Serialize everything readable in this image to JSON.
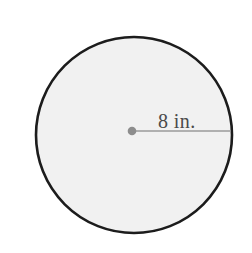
{
  "figure": {
    "type": "geometry-diagram",
    "shape": "circle",
    "background_color": "#ffffff",
    "canvas": {
      "width": 252,
      "height": 253
    },
    "circle": {
      "name": "shaded-circle",
      "center_x": 134,
      "center_y": 135,
      "radius": 98,
      "fill_color": "#f1f1f1",
      "stroke_color": "#1c1c1c",
      "stroke_width": 2.6
    },
    "center_dot": {
      "name": "center-point",
      "x": 132,
      "y": 131,
      "radius": 4.3,
      "color": "#8d8d8d"
    },
    "radius_line": {
      "name": "radius-segment",
      "x1": 132,
      "y1": 131,
      "x2": 231,
      "y2": 131,
      "color": "#9a9a9a",
      "stroke_width": 1.6
    },
    "radius_label": {
      "name": "radius-measurement-label",
      "text": "8 in.",
      "value": 8,
      "unit": "in.",
      "x": 158,
      "y": 128,
      "color": "#4a4a4a",
      "font_size": 20
    }
  }
}
